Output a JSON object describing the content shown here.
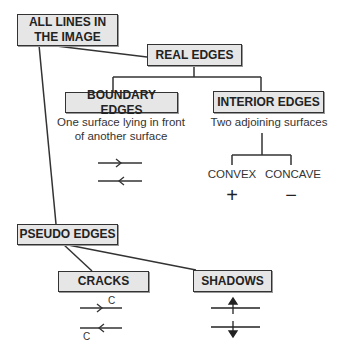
{
  "diagram": {
    "root": {
      "label": "ALL LINES IN THE IMAGE"
    },
    "real_edges": {
      "label": "REAL EDGES",
      "boundary": {
        "label": "BOUNDARY EDGES",
        "description": "One surface lying in front of another surface"
      },
      "interior": {
        "label": "INTERIOR EDGES",
        "description": "Two adjoining surfaces",
        "convex": {
          "label": "CONVEX",
          "symbol": "+"
        },
        "concave": {
          "label": "CONCAVE",
          "symbol": "−"
        }
      }
    },
    "pseudo_edges": {
      "label": "PSEUDO EDGES",
      "cracks": {
        "label": "CRACKS",
        "mark_top": "C",
        "mark_bottom": "C"
      },
      "shadows": {
        "label": "SHADOWS"
      }
    }
  }
}
